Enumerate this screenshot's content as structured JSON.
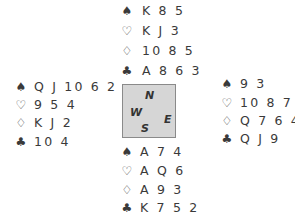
{
  "deal": {
    "north": {
      "spades": "K 8 5",
      "hearts": "K J 3",
      "diamonds": "10 8 5",
      "clubs": "A 8 6 3"
    },
    "west": {
      "spades": "Q J 10 6 2",
      "hearts": "9 5 4",
      "diamonds": "K J 2",
      "clubs": "10 4"
    },
    "east": {
      "spades": "9 3",
      "hearts": "10 8 7 2",
      "diamonds": "Q 7 6 4",
      "clubs": "Q J 9"
    },
    "south": {
      "spades": "A 7 4",
      "hearts": "A Q 6",
      "diamonds": "A 9 3",
      "clubs": "K 7 5 2"
    }
  },
  "compass": {
    "n": "N",
    "w": "W",
    "e": "E",
    "s": "S"
  },
  "suits": {
    "spades": "♠",
    "hearts": "♡",
    "diamonds": "♢",
    "clubs": "♣"
  }
}
